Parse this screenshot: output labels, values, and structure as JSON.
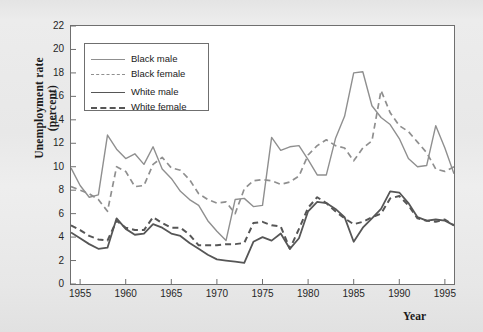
{
  "figure": {
    "background_color": "#e9e9e9",
    "plot_background": "#ffffff",
    "frame_color": "#6f6f6f"
  },
  "axes": {
    "ylabel_line1": "Unemployment rate",
    "ylabel_line2": "(percent)",
    "xlabel": "Year",
    "yticks": [
      0,
      2,
      4,
      6,
      8,
      10,
      12,
      14,
      16,
      18,
      20,
      22
    ],
    "xticks": [
      1955,
      1960,
      1965,
      1970,
      1975,
      1980,
      1985,
      1990,
      1995
    ]
  },
  "legend": {
    "items": [
      {
        "label": "Black male",
        "color": "#8f8f8f",
        "style": "solid",
        "width": 1.4
      },
      {
        "label": "Black female",
        "color": "#8f8f8f",
        "style": "dashed",
        "width": 1.6
      },
      {
        "label": "White male",
        "color": "#565656",
        "style": "solid",
        "width": 1.8
      },
      {
        "label": "White female",
        "color": "#565656",
        "style": "dashed",
        "width": 2.0
      }
    ]
  },
  "chart_data": {
    "type": "line",
    "title": "",
    "xlabel": "Year",
    "ylabel": "Unemployment rate (percent)",
    "xlim": [
      1954,
      1996
    ],
    "ylim": [
      0,
      22
    ],
    "grid": false,
    "legend_position": "upper-left",
    "x": [
      1954,
      1955,
      1956,
      1957,
      1958,
      1959,
      1960,
      1961,
      1962,
      1963,
      1964,
      1965,
      1966,
      1967,
      1968,
      1969,
      1970,
      1971,
      1972,
      1973,
      1974,
      1975,
      1976,
      1977,
      1978,
      1979,
      1980,
      1981,
      1982,
      1983,
      1984,
      1985,
      1986,
      1987,
      1988,
      1989,
      1990,
      1991,
      1992,
      1993,
      1994,
      1995,
      1996
    ],
    "series": [
      {
        "name": "Black male",
        "color": "#8f8f8f",
        "style": "solid",
        "values": [
          9.9,
          8.4,
          7.4,
          7.6,
          12.7,
          11.5,
          10.7,
          11.1,
          10.2,
          11.7,
          9.8,
          9.0,
          7.9,
          7.2,
          6.7,
          5.4,
          4.5,
          3.7,
          7.2,
          7.3,
          6.6,
          6.7,
          12.5,
          11.4,
          11.7,
          11.8,
          10.6,
          9.3,
          9.3,
          12.4,
          14.3,
          18.0,
          18.1,
          15.2,
          14.2,
          13.6,
          12.4,
          10.7,
          10.0,
          10.1,
          13.5,
          11.6,
          9.4
        ]
      },
      {
        "name": "Black female",
        "color": "#8f8f8f",
        "style": "dashed",
        "values": [
          8.3,
          8.0,
          7.7,
          7.2,
          6.2,
          10.0,
          9.6,
          8.3,
          8.4,
          10.2,
          10.8,
          9.9,
          9.7,
          8.9,
          7.7,
          7.2,
          6.9,
          7.0,
          6.0,
          8.1,
          8.8,
          8.9,
          8.8,
          8.5,
          8.7,
          9.2,
          11.0,
          11.8,
          12.3,
          11.8,
          11.6,
          10.5,
          11.6,
          12.2,
          16.5,
          14.6,
          13.5,
          13.0,
          12.1,
          11.2,
          9.8,
          9.6,
          10.0
        ]
      },
      {
        "name": "White male",
        "color": "#565656",
        "style": "solid",
        "values": [
          4.4,
          3.9,
          3.4,
          3.0,
          3.1,
          5.6,
          4.7,
          4.2,
          4.3,
          5.1,
          4.8,
          4.3,
          4.1,
          3.5,
          3.0,
          2.5,
          2.1,
          2.0,
          1.9,
          1.8,
          3.6,
          4.0,
          3.7,
          4.3,
          3.0,
          3.9,
          6.2,
          7.0,
          6.9,
          6.4,
          5.7,
          3.6,
          4.8,
          5.6,
          6.4,
          7.9,
          7.8,
          6.9,
          5.7,
          5.4,
          5.5,
          5.4,
          5.0
        ]
      },
      {
        "name": "White female",
        "color": "#565656",
        "style": "dashed",
        "values": [
          5.0,
          4.6,
          4.1,
          3.8,
          3.7,
          5.4,
          4.8,
          4.6,
          4.6,
          5.7,
          5.2,
          4.8,
          4.8,
          4.2,
          3.3,
          3.3,
          3.3,
          3.4,
          3.4,
          3.5,
          5.2,
          5.3,
          5.0,
          4.9,
          3.0,
          4.7,
          6.5,
          7.4,
          6.9,
          6.2,
          5.6,
          5.1,
          5.3,
          5.7,
          6.0,
          7.3,
          7.5,
          6.7,
          5.6,
          5.4,
          5.3,
          5.5,
          5.0
        ]
      }
    ]
  }
}
